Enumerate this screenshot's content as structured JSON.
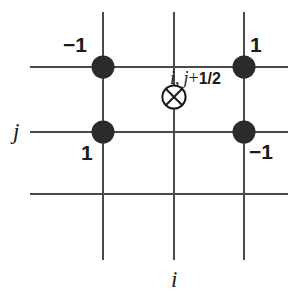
{
  "figure": {
    "background_color": "#ffffff",
    "line_color": "#4a4a4a",
    "node_color": "#2b2b2b",
    "text_color": "#1b1b1b",
    "width": 298,
    "height": 298
  },
  "axes": {
    "x_axis_label": "i",
    "y_axis_label": "j"
  },
  "grid": {
    "vertical_lines_x": [
      103,
      174,
      244
    ],
    "vertical_span_y": [
      12,
      260
    ],
    "horizontal_lines_y": [
      67,
      132,
      194
    ],
    "horizontal_span_x": [
      30,
      288
    ]
  },
  "nodes": [
    {
      "id": "node-top-left",
      "x": 103,
      "y": 67,
      "value": "−1",
      "label_x": 63,
      "label_y": 34
    },
    {
      "id": "node-top-right",
      "x": 244,
      "y": 67,
      "value": "1",
      "label_x": 250,
      "label_y": 34
    },
    {
      "id": "node-bottom-left",
      "x": 103,
      "y": 132,
      "value": "1",
      "label_x": 81,
      "label_y": 142
    },
    {
      "id": "node-bottom-right",
      "x": 244,
      "y": 132,
      "value": "−1",
      "label_x": 249,
      "label_y": 141
    }
  ],
  "marker": {
    "id": "cross-circle-marker",
    "x": 174,
    "y": 97,
    "glyph": "crossed-circle",
    "label_prefix": "i,",
    "label_var": "j",
    "label_oper": "+",
    "label_num": "1/2",
    "label_full": "i, j+1/2",
    "label_x": 170,
    "label_y": 68
  }
}
